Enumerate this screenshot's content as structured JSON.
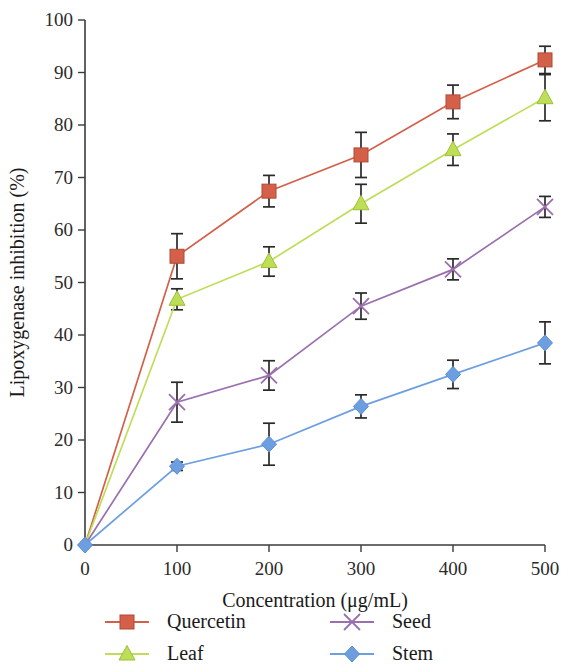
{
  "chart_data": {
    "type": "line",
    "title": "",
    "xlabel": "Concentration (μg/mL)",
    "ylabel": "Lipoxygenase inhibition (%)",
    "x": [
      0,
      100,
      200,
      300,
      400,
      500
    ],
    "xlim": [
      0,
      500
    ],
    "ylim": [
      0,
      100
    ],
    "xticks": [
      "0",
      "100",
      "200",
      "300",
      "400",
      "500"
    ],
    "yticks": [
      "0",
      "10",
      "20",
      "30",
      "40",
      "50",
      "60",
      "70",
      "80",
      "90",
      "100"
    ],
    "grid": false,
    "legend_position": "bottom",
    "series": [
      {
        "name": "Quercetin",
        "color": "#d4604a",
        "marker": "square",
        "values": [
          0,
          55.0,
          67.4,
          74.3,
          84.4,
          92.4
        ],
        "errors": [
          0,
          4.3,
          3.0,
          4.3,
          3.2,
          2.6
        ]
      },
      {
        "name": "Leaf",
        "color": "#bede58",
        "marker": "triangle",
        "values": [
          0,
          46.8,
          54.0,
          65.0,
          75.3,
          85.2
        ],
        "errors": [
          0,
          2.0,
          2.8,
          3.7,
          3.0,
          4.4
        ]
      },
      {
        "name": "Seed",
        "color": "#9b6fae",
        "marker": "cross",
        "values": [
          0,
          27.2,
          32.3,
          45.5,
          52.5,
          64.4
        ],
        "errors": [
          0,
          3.8,
          2.8,
          2.5,
          2.0,
          2.0
        ]
      },
      {
        "name": "Stem",
        "color": "#6d9fe0",
        "marker": "diamond",
        "values": [
          0,
          15.0,
          19.2,
          26.4,
          32.5,
          38.5
        ],
        "errors": [
          0,
          0.8,
          4.0,
          2.2,
          2.7,
          4.0
        ]
      }
    ]
  },
  "legend": {
    "items": [
      {
        "label": "Quercetin"
      },
      {
        "label": "Leaf"
      },
      {
        "label": "Seed"
      },
      {
        "label": "Stem"
      }
    ]
  }
}
